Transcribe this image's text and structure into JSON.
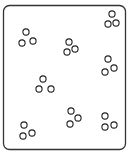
{
  "diagram": {
    "width": 135,
    "height": 155,
    "background": "#ffffff",
    "frame": {
      "x": 3.5,
      "y": 5.5,
      "width": 122,
      "height": 144,
      "rx": 6,
      "stroke": "#333333",
      "stroke_width": 1.3
    },
    "circle_style": {
      "r": 3.1,
      "stroke": "#222222",
      "stroke_width": 1.1,
      "fill": "#ffffff"
    },
    "clusters": [
      {
        "name": "cluster-top-left",
        "circles": [
          [
            26,
            32
          ],
          [
            22,
            43
          ],
          [
            33,
            41
          ]
        ]
      },
      {
        "name": "cluster-top-middle",
        "circles": [
          [
            69,
            42
          ],
          [
            67,
            52
          ],
          [
            75,
            49
          ]
        ]
      },
      {
        "name": "cluster-top-right",
        "circles": [
          [
            112,
            14
          ],
          [
            108,
            24
          ],
          [
            116,
            23
          ]
        ]
      },
      {
        "name": "cluster-right-middle",
        "circles": [
          [
            108,
            59
          ],
          [
            105,
            72
          ],
          [
            114,
            68
          ]
        ]
      },
      {
        "name": "cluster-center-left",
        "circles": [
          [
            43,
            79
          ],
          [
            39,
            89
          ],
          [
            51,
            89
          ]
        ]
      },
      {
        "name": "cluster-bottom-middle",
        "circles": [
          [
            71,
            111
          ],
          [
            70,
            124
          ],
          [
            78,
            118
          ]
        ]
      },
      {
        "name": "cluster-bottom-right",
        "circles": [
          [
            105,
            116
          ],
          [
            105,
            127
          ],
          [
            114,
            125
          ]
        ]
      },
      {
        "name": "cluster-bottom-left",
        "circles": [
          [
            24,
            125
          ],
          [
            23,
            136
          ],
          [
            32,
            133
          ]
        ]
      }
    ]
  }
}
